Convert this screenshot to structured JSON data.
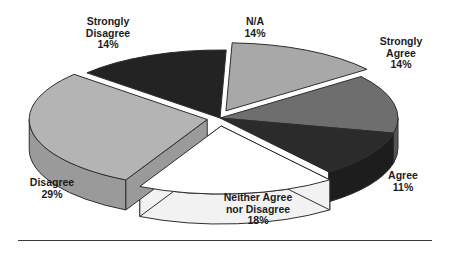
{
  "chart_data": {
    "type": "pie",
    "title": "",
    "subtitle": "",
    "xlabel": "",
    "ylabel": "",
    "legend_position": "none",
    "grid": false,
    "style": "3d-exploded-pie",
    "units": "percent",
    "total": "100%",
    "categories": [
      "N/A",
      "Strongly Agree",
      "Agree",
      "Neither Agree nor Disagree",
      "Disagree",
      "Strongly Disagree"
    ],
    "values": [
      14,
      14,
      11,
      18,
      29,
      14
    ],
    "labels": [
      "14%",
      "14%",
      "11%",
      "18%",
      "29%",
      "14%"
    ],
    "slices": [
      {
        "name": "N/A",
        "label": "N/A",
        "value": 14,
        "pct_text": "14%",
        "color": "#a8a8a8",
        "side_color": "#8d8d8d",
        "exploded": true
      },
      {
        "name": "Strongly Agree",
        "label": "Strongly Agree",
        "value": 14,
        "pct_text": "14%",
        "color": "#6e6e6e",
        "side_color": "#565656",
        "exploded": false
      },
      {
        "name": "Agree",
        "label": "Agree",
        "value": 11,
        "pct_text": "11%",
        "color": "#2b2b2b",
        "side_color": "#1d1d1d",
        "exploded": false
      },
      {
        "name": "Neither Agree nor Disagree",
        "label": "Neither Agree nor Disagree",
        "value": 18,
        "pct_text": "18%",
        "color": "#ffffff",
        "side_color": "#f2f2f2",
        "exploded": true
      },
      {
        "name": "Disagree",
        "label": "Disagree",
        "value": 29,
        "pct_text": "29%",
        "color": "#b4b4b4",
        "side_color": "#9a9a9a",
        "exploded": true
      },
      {
        "name": "Strongly Disagree",
        "label": "Strongly Disagree",
        "value": 14,
        "pct_text": "14%",
        "color": "#232323",
        "side_color": "#171717",
        "exploded": false
      }
    ]
  },
  "labels": {
    "strongly_disagree": {
      "line1": "Strongly",
      "line2": "Disagree",
      "pct": "14%"
    },
    "na": {
      "line1": "N/A",
      "line2": "",
      "pct": "14%"
    },
    "strongly_agree": {
      "line1": "Strongly",
      "line2": "Agree",
      "pct": "14%"
    },
    "agree": {
      "line1": "Agree",
      "line2": "",
      "pct": "11%"
    },
    "neither": {
      "line1": "Neither Agree",
      "line2": "nor Disagree",
      "pct": "18%"
    },
    "disagree": {
      "line1": "Disagree",
      "line2": "",
      "pct": "29%"
    }
  },
  "colors": {
    "background": "#ffffff",
    "text": "#1c1c1c",
    "outline": "#2e2e2e",
    "rule": "#3b3b3b"
  }
}
